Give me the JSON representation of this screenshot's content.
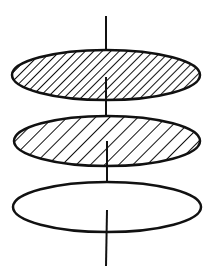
{
  "diagram": {
    "colors": {
      "stroke": "#111111",
      "background": "#ffffff"
    },
    "axis": {
      "x": 106,
      "y_top": 16,
      "y_bottom": 266
    },
    "layers": [
      {
        "name": "top-layer",
        "cx": 106,
        "cy": 75,
        "rx": 94,
        "ry": 25,
        "fill": "dense-hatch"
      },
      {
        "name": "middle-layer",
        "cx": 107,
        "cy": 141,
        "rx": 93,
        "ry": 25,
        "fill": "sparse-hatch"
      },
      {
        "name": "bottom-layer",
        "cx": 107,
        "cy": 207,
        "rx": 94,
        "ry": 25,
        "fill": "none"
      }
    ]
  }
}
